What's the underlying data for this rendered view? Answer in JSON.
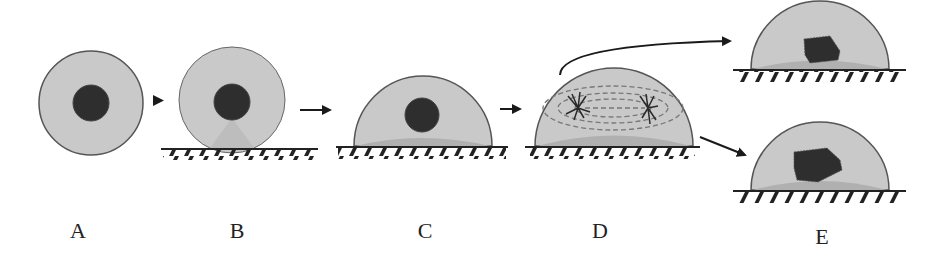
{
  "figure": {
    "colors": {
      "cytoplasm": "#c9c9c9",
      "cytoplasm_outline": "#555555",
      "base_shade": "#b4b4b4",
      "nucleus": "#2e2e2e",
      "substrate_line": "#222222",
      "hatch": "#222222",
      "arrow": "#1a1a1a"
    },
    "stages": [
      {
        "id": "A",
        "label": "A",
        "description": "Round cell in suspension with central nucleus"
      },
      {
        "id": "B",
        "label": "B",
        "description": "Round cell contacting substrate"
      },
      {
        "id": "C",
        "label": "C",
        "description": "Cell spread as dome on substrate"
      },
      {
        "id": "D",
        "label": "D",
        "description": "Cell undergoing mitosis with spindle"
      },
      {
        "id": "E",
        "label": "E",
        "description": "Two daughter cells with irregular nuclei"
      }
    ],
    "arrows": [
      {
        "from": "A",
        "to": "B"
      },
      {
        "from": "B",
        "to": "C"
      },
      {
        "from": "C",
        "to": "D"
      },
      {
        "from": "D",
        "to": "E-top"
      },
      {
        "from": "D",
        "to": "E-bottom"
      }
    ]
  }
}
